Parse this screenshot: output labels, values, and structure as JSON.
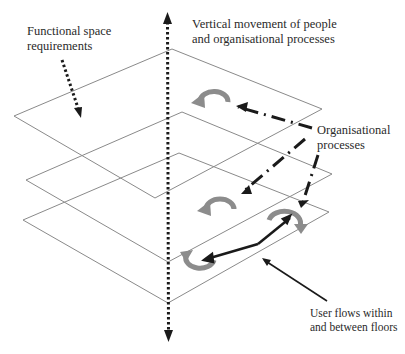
{
  "labels": {
    "functional_space": [
      "Functional space",
      "requirements"
    ],
    "vertical_movement": [
      "Vertical movement of people",
      "and organisational processes"
    ],
    "organisational_processes": [
      "Organisational",
      "processes"
    ],
    "user_flows": [
      "User flows within",
      "and between floors"
    ]
  },
  "floors": [
    {
      "name": "top floor",
      "left": [
        14,
        116
      ],
      "top": [
        172,
        49
      ],
      "right": [
        322,
        109
      ],
      "bottom": [
        155,
        198
      ]
    },
    {
      "name": "middle floor",
      "left": [
        26,
        180
      ],
      "top": [
        182,
        112
      ],
      "right": [
        332,
        174
      ],
      "bottom": [
        168,
        262
      ]
    },
    {
      "name": "bottom floor",
      "left": [
        23,
        220
      ],
      "top": [
        179,
        153
      ],
      "right": [
        329,
        212
      ],
      "bottom": [
        168,
        303
      ]
    }
  ],
  "colors": {
    "floor_outline": "#8a8a8a",
    "arrow_dark": "#1a1a1a",
    "process_cycle": "#8c8c8c",
    "text": "#2a2a2a"
  }
}
